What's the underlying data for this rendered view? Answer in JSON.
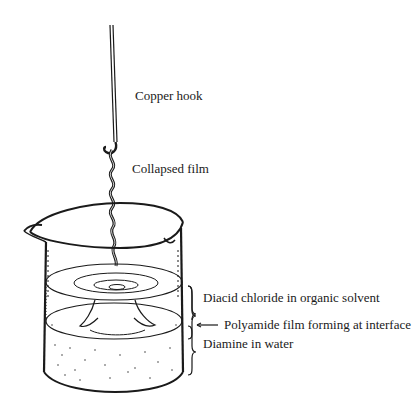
{
  "figure": {
    "type": "illustration",
    "labels": {
      "copper_hook": "Copper hook",
      "collapsed_film": "Collapsed film",
      "organic_layer": "Diacid chloride in organic solvent",
      "interface": "Polyamide film forming at interface",
      "aqueous_layer": "Diamine in water"
    },
    "colors": {
      "ink": "#1a1a1a",
      "background": "#ffffff"
    }
  }
}
